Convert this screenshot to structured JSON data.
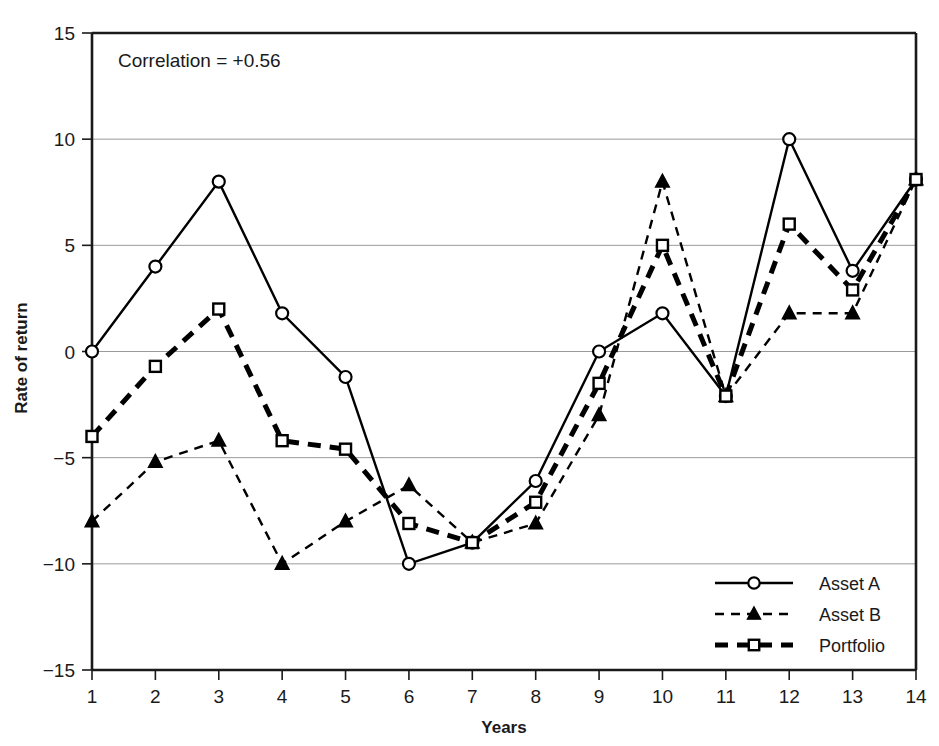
{
  "chart_data": {
    "type": "line",
    "title": "",
    "xlabel": "Years",
    "ylabel": "Rate of return",
    "x": [
      1,
      2,
      3,
      4,
      5,
      6,
      7,
      8,
      9,
      10,
      11,
      12,
      13,
      14
    ],
    "xticklabels": [
      "1",
      "2",
      "3",
      "4",
      "5",
      "6",
      "7",
      "8",
      "9",
      "10",
      "11",
      "12",
      "13",
      "14"
    ],
    "yticks": [
      15,
      10,
      5,
      0,
      -5,
      -10,
      -15
    ],
    "yticklabels": [
      "15",
      "10",
      "5",
      "0",
      "−5",
      "−10",
      "−15"
    ],
    "xlim": [
      1,
      14
    ],
    "ylim": [
      -15,
      15
    ],
    "grid": true,
    "grid_axis": "y",
    "legend_position": "lower-right",
    "annotations": [
      {
        "text": "Correlation = +0.56",
        "x": 1.25,
        "y": 13.6
      }
    ],
    "series": [
      {
        "name": "Asset A",
        "marker": "circle",
        "linestyle": "solid",
        "color": "#000000",
        "values": [
          0,
          4,
          8,
          1.8,
          -1.2,
          -10,
          -9,
          -6.1,
          0,
          1.8,
          -2.1,
          10,
          3.8,
          8.1
        ]
      },
      {
        "name": "Asset B",
        "marker": "triangle",
        "linestyle": "dashed",
        "color": "#000000",
        "values": [
          -8,
          -5.2,
          -4.2,
          -10,
          -8,
          -6.3,
          -9,
          -8.1,
          -3,
          8,
          -2.1,
          1.8,
          1.8,
          8.1
        ]
      },
      {
        "name": "Portfolio",
        "marker": "square",
        "linestyle": "thick-dashed",
        "color": "#000000",
        "values": [
          -4,
          -0.7,
          2,
          -4.2,
          -4.6,
          -8.1,
          -9,
          -7.1,
          -1.5,
          5,
          -2.1,
          6,
          2.9,
          8.1
        ]
      }
    ]
  },
  "legend": {
    "items": [
      {
        "label": "Asset A"
      },
      {
        "label": "Asset B"
      },
      {
        "label": "Portfolio"
      }
    ]
  },
  "axes": {
    "x_title": "Years",
    "y_title": "Rate of return"
  },
  "annotation": {
    "correlation_label": "Correlation = +0.56"
  },
  "colors": {
    "line": "#000000",
    "grid": "#9a9a9a",
    "frame": "#1a1a1a",
    "background": "#ffffff"
  }
}
